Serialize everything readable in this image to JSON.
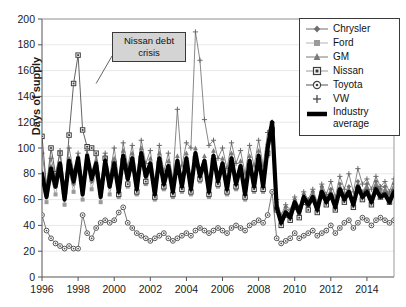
{
  "chart_data": {
    "type": "line",
    "title": "",
    "xlabel": "",
    "ylabel": "Days of supply",
    "ylim": [
      0,
      200
    ],
    "ytick_step": 20,
    "yticks": [
      "0",
      "20",
      "40",
      "60",
      "80",
      "100",
      "120",
      "140",
      "160",
      "180",
      "200"
    ],
    "xlim": [
      1996,
      2015.5
    ],
    "xticks": [
      "1996",
      "1998",
      "2000",
      "2002",
      "2004",
      "2006",
      "2008",
      "2010",
      "2012",
      "2014"
    ],
    "xtick_values": [
      1996,
      1998,
      2000,
      2002,
      2004,
      2006,
      2008,
      2010,
      2012,
      2014
    ],
    "grid": "horizontal-faint",
    "legend_position": "top-right",
    "frequency": "quarterly",
    "x_start": 1996.0,
    "x_step": 0.25,
    "annotations": [
      {
        "text": "Nissan debt crisis",
        "line1": "Nissan debt",
        "line2": "crisis",
        "points_to_x": 1999.0,
        "points_to_y": 150
      }
    ],
    "series": [
      {
        "name": "Chrysler",
        "marker": "diamond",
        "color": "#6e6e6e",
        "values": [
          78,
          64,
          82,
          70,
          84,
          62,
          88,
          72,
          90,
          66,
          92,
          74,
          86,
          64,
          90,
          70,
          88,
          68,
          94,
          76,
          92,
          70,
          96,
          78,
          88,
          66,
          92,
          74,
          86,
          68,
          90,
          72,
          92,
          70,
          96,
          80,
          90,
          68,
          94,
          76,
          88,
          70,
          92,
          74,
          86,
          66,
          90,
          72,
          94,
          72,
          100,
          120,
          58,
          46,
          54,
          50,
          60,
          52,
          64,
          58,
          66,
          56,
          70,
          62,
          68,
          58,
          72,
          64,
          70,
          60,
          74,
          66,
          72,
          62,
          74,
          68,
          70,
          64,
          72,
          66
        ]
      },
      {
        "name": "Ford",
        "marker": "square",
        "color": "#9a9a9a",
        "values": [
          72,
          58,
          76,
          64,
          80,
          56,
          82,
          66,
          84,
          60,
          86,
          68,
          80,
          58,
          84,
          64,
          82,
          62,
          88,
          70,
          86,
          64,
          90,
          72,
          82,
          60,
          86,
          68,
          80,
          62,
          84,
          66,
          86,
          64,
          90,
          74,
          84,
          62,
          88,
          70,
          82,
          64,
          86,
          68,
          80,
          60,
          84,
          66,
          88,
          66,
          94,
          112,
          54,
          42,
          50,
          46,
          56,
          48,
          60,
          54,
          62,
          52,
          66,
          58,
          64,
          54,
          68,
          60,
          66,
          56,
          70,
          62,
          68,
          58,
          70,
          64,
          66,
          60,
          68,
          62
        ]
      },
      {
        "name": "GM",
        "marker": "triangle",
        "color": "#7a7a7a",
        "values": [
          82,
          66,
          86,
          72,
          88,
          64,
          92,
          74,
          94,
          68,
          96,
          76,
          90,
          66,
          94,
          72,
          92,
          70,
          98,
          78,
          96,
          72,
          100,
          80,
          92,
          68,
          96,
          76,
          90,
          70,
          94,
          74,
          96,
          72,
          100,
          82,
          94,
          70,
          98,
          78,
          92,
          72,
          96,
          76,
          90,
          68,
          94,
          74,
          98,
          74,
          104,
          118,
          56,
          44,
          52,
          48,
          58,
          50,
          62,
          56,
          64,
          54,
          68,
          60,
          66,
          56,
          70,
          62,
          68,
          58,
          72,
          64,
          70,
          60,
          72,
          66,
          68,
          62,
          70,
          64
        ]
      },
      {
        "name": "Nissan",
        "marker": "square-dark",
        "color": "#3c3c3c",
        "values": [
          109,
          70,
          100,
          80,
          96,
          66,
          110,
          150,
          172,
          114,
          101,
          100,
          96,
          70,
          92,
          76,
          88,
          64,
          90,
          72,
          86,
          66,
          92,
          74,
          84,
          62,
          88,
          70,
          82,
          64,
          86,
          68,
          88,
          66,
          92,
          76,
          86,
          64,
          90,
          72,
          84,
          66,
          88,
          70,
          82,
          62,
          86,
          68,
          90,
          68,
          96,
          114,
          52,
          40,
          48,
          44,
          54,
          46,
          58,
          52,
          60,
          50,
          64,
          56,
          62,
          52,
          66,
          58,
          64,
          54,
          68,
          60,
          66,
          56,
          68,
          62,
          64,
          58,
          66,
          60
        ]
      },
      {
        "name": "Toyota",
        "marker": "circle",
        "color": "#555555",
        "values": [
          48,
          36,
          30,
          26,
          24,
          22,
          24,
          22,
          22,
          48,
          34,
          30,
          38,
          42,
          44,
          42,
          44,
          50,
          54,
          42,
          38,
          34,
          32,
          30,
          28,
          30,
          32,
          34,
          30,
          28,
          30,
          32,
          34,
          32,
          36,
          38,
          36,
          34,
          36,
          38,
          36,
          34,
          38,
          40,
          38,
          36,
          40,
          42,
          44,
          42,
          48,
          66,
          30,
          26,
          28,
          30,
          34,
          30,
          32,
          34,
          36,
          32,
          34,
          36,
          40,
          34,
          38,
          42,
          44,
          38,
          42,
          46,
          44,
          40,
          44,
          46,
          44,
          42,
          44,
          46
        ]
      },
      {
        "name": "VW",
        "marker": "plus",
        "color": "#6a6a6a",
        "values": [
          96,
          72,
          92,
          78,
          98,
          70,
          100,
          82,
          96,
          74,
          98,
          80,
          94,
          72,
          96,
          78,
          100,
          76,
          104,
          86,
          102,
          78,
          106,
          88,
          98,
          74,
          102,
          82,
          96,
          76,
          130,
          86,
          104,
          100,
          190,
          168,
          122,
          102,
          106,
          92,
          100,
          84,
          104,
          88,
          98,
          80,
          102,
          86,
          106,
          86,
          112,
          120,
          60,
          48,
          56,
          52,
          62,
          54,
          66,
          60,
          68,
          58,
          72,
          64,
          74,
          62,
          78,
          68,
          80,
          66,
          84,
          72,
          76,
          68,
          78,
          70,
          74,
          66,
          76,
          68
        ]
      },
      {
        "name": "Industry average",
        "marker": "none",
        "color": "#000000",
        "thick": true,
        "values": [
          80,
          62,
          84,
          70,
          88,
          60,
          90,
          74,
          92,
          64,
          94,
          76,
          88,
          62,
          90,
          70,
          88,
          66,
          94,
          76,
          92,
          68,
          96,
          78,
          88,
          64,
          92,
          72,
          86,
          66,
          90,
          70,
          92,
          68,
          96,
          78,
          90,
          66,
          94,
          74,
          88,
          68,
          92,
          72,
          86,
          64,
          90,
          70,
          94,
          70,
          100,
          120,
          54,
          42,
          50,
          46,
          58,
          50,
          62,
          56,
          62,
          52,
          66,
          58,
          64,
          54,
          68,
          60,
          66,
          56,
          70,
          62,
          66,
          58,
          68,
          62,
          64,
          58,
          66,
          60
        ]
      }
    ]
  },
  "legend": {
    "items": [
      {
        "label": "Chrysler",
        "marker": "diamond"
      },
      {
        "label": "Ford",
        "marker": "square"
      },
      {
        "label": "GM",
        "marker": "triangle"
      },
      {
        "label": "Nissan",
        "marker": "square-dark"
      },
      {
        "label": "Toyota",
        "marker": "circle"
      },
      {
        "label": "VW",
        "marker": "plus"
      },
      {
        "label": "Industry",
        "marker": "thick-line"
      },
      {
        "label": "average",
        "marker": "none"
      }
    ],
    "industry_line1": "Industry",
    "industry_line2": "average"
  },
  "axis": {
    "y_title": "Days of supply"
  }
}
